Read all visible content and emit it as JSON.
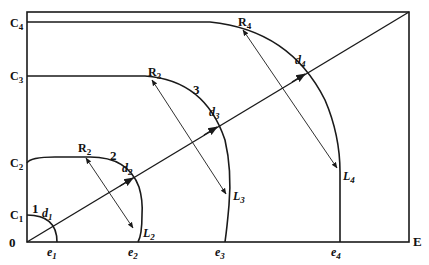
{
  "diagram": {
    "type": "contour-lines-with-diagonal",
    "colors": {
      "line": "#1a1a1a",
      "background": "#ffffff"
    },
    "axes": {
      "origin_label": "0",
      "x_end_label": "E",
      "y_labels": [
        {
          "base": "C",
          "sub": "1"
        },
        {
          "base": "C",
          "sub": "2"
        },
        {
          "base": "C",
          "sub": "3"
        },
        {
          "base": "C",
          "sub": "4"
        }
      ],
      "x_labels": [
        {
          "base": "e",
          "sub": "1"
        },
        {
          "base": "e",
          "sub": "2"
        },
        {
          "base": "e",
          "sub": "3"
        },
        {
          "base": "e",
          "sub": "4"
        }
      ]
    },
    "curves": [
      {
        "number": "1",
        "d": {
          "base": "d",
          "sub": "1"
        }
      },
      {
        "number": "2",
        "d": {
          "base": "d",
          "sub": "2"
        },
        "R": {
          "base": "R",
          "sub": "2"
        },
        "L": {
          "base": "L",
          "sub": "2"
        }
      },
      {
        "number": "3",
        "d": {
          "base": "d",
          "sub": "3"
        },
        "R": {
          "base": "R",
          "sub": "3"
        },
        "L": {
          "base": "L",
          "sub": "3"
        }
      },
      {
        "number": "",
        "d": {
          "base": "d",
          "sub": "4"
        },
        "R": {
          "base": "R",
          "sub": "4"
        },
        "L": {
          "base": "L",
          "sub": "4"
        }
      }
    ]
  }
}
